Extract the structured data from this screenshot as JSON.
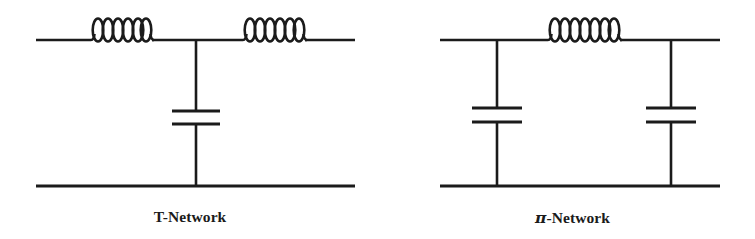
{
  "figure": {
    "background_color": "#ffffff",
    "ink_color": "#1b1b1b",
    "width": 755,
    "height": 239
  },
  "networks": [
    {
      "id": "t-network",
      "caption": "T-Network",
      "caption_center_x": 190,
      "topology": "T",
      "components": [
        {
          "type": "inductor",
          "name": "series-inductor-left",
          "orientation": "horizontal",
          "turns": 6,
          "x1": 88,
          "x2": 152,
          "y": 40
        },
        {
          "type": "inductor",
          "name": "series-inductor-right",
          "orientation": "horizontal",
          "turns": 6,
          "x1": 240,
          "x2": 305,
          "y": 40
        },
        {
          "type": "capacitor",
          "name": "shunt-capacitor",
          "orientation": "vertical",
          "x": 196,
          "plate_top_y": 111,
          "plate_bottom_y": 124,
          "plate_half_width": 24
        }
      ],
      "wires": {
        "top_rail_y": 40,
        "bottom_rail_y": 186,
        "left_x": 36,
        "right_x": 355,
        "shunt_x": 196
      }
    },
    {
      "id": "pi-network",
      "caption": "π-Network",
      "caption_symbol": "π",
      "caption_text": "-Network",
      "caption_center_x": 580,
      "topology": "Pi",
      "components": [
        {
          "type": "inductor",
          "name": "series-inductor",
          "orientation": "horizontal",
          "turns": 7,
          "x1": 545,
          "x2": 620,
          "y": 40
        },
        {
          "type": "capacitor",
          "name": "shunt-capacitor-left",
          "orientation": "vertical",
          "x": 497,
          "plate_top_y": 108,
          "plate_bottom_y": 122,
          "plate_half_width": 25
        },
        {
          "type": "capacitor",
          "name": "shunt-capacitor-right",
          "orientation": "vertical",
          "x": 671,
          "plate_top_y": 108,
          "plate_bottom_y": 122,
          "plate_half_width": 25
        }
      ],
      "wires": {
        "top_rail_y": 40,
        "bottom_rail_y": 186,
        "left_x": 440,
        "right_x": 720,
        "shunt_left_x": 497,
        "shunt_right_x": 671
      }
    }
  ]
}
